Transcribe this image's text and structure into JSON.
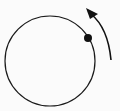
{
  "diagram": {
    "circle": {
      "cx": 50,
      "cy": 61,
      "r": 45,
      "stroke": "#1a1a1a"
    },
    "point": {
      "cx": 88,
      "cy": 38,
      "r": 4,
      "fill": "#111111"
    },
    "arrow": {
      "direction": "counterclockwise",
      "color": "#111111"
    },
    "background": "#fbfbfb"
  }
}
